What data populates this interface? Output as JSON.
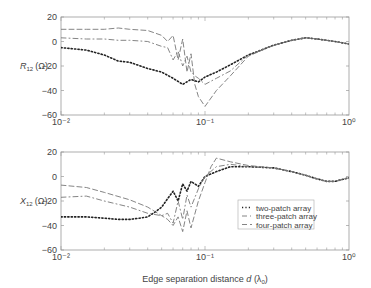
{
  "figure": {
    "xlabel_prefix": "Edge separation distance ",
    "xlabel_var": "d",
    "xlabel_unit": "(λ",
    "xlabel_sub": "0",
    "xlabel_close": ")"
  },
  "chart_data": [
    {
      "type": "line",
      "title": "",
      "ylabel": "R12 (Ω)",
      "ylabel_main": "R",
      "ylabel_sub": "12",
      "ylabel_unit": "(Ω)",
      "xlabel": "",
      "xscale": "log",
      "xlim": [
        0.01,
        1
      ],
      "ylim": [
        -60,
        20
      ],
      "yticks": [
        20,
        0,
        -20,
        -40,
        -60
      ],
      "xtick_labels": [
        "10⁻²",
        "10⁻¹",
        "10⁰"
      ],
      "grid": false,
      "series": [
        {
          "name": "two-patch array",
          "style": "dotted",
          "x": [
            0.01,
            0.015,
            0.02,
            0.025,
            0.03,
            0.04,
            0.05,
            0.06,
            0.07,
            0.08,
            0.09,
            0.1,
            0.12,
            0.15,
            0.2,
            0.3,
            0.4,
            0.5,
            0.6,
            0.8,
            1.0
          ],
          "y": [
            -5,
            -7,
            -11,
            -16,
            -17,
            -22,
            -25,
            -30,
            -35,
            -31,
            -33,
            -29,
            -25,
            -19,
            -11,
            -3,
            1,
            3,
            2,
            0,
            -2
          ]
        },
        {
          "name": "three-patch array",
          "style": "dash-dot",
          "x": [
            0.01,
            0.015,
            0.02,
            0.025,
            0.03,
            0.04,
            0.05,
            0.055,
            0.06,
            0.065,
            0.07,
            0.075,
            0.08,
            0.085,
            0.09,
            0.1,
            0.12,
            0.15,
            0.2,
            0.3,
            0.4,
            0.5,
            0.6,
            0.8,
            1.0
          ],
          "y": [
            3,
            2,
            2,
            1,
            1,
            0,
            -4,
            -5,
            -15,
            -8,
            -20,
            -12,
            -25,
            -28,
            -30,
            -35,
            -30,
            -24,
            -11,
            -3,
            1,
            3,
            2,
            0,
            -2
          ]
        },
        {
          "name": "four-patch array",
          "style": "dashed",
          "x": [
            0.01,
            0.015,
            0.02,
            0.025,
            0.03,
            0.04,
            0.05,
            0.055,
            0.06,
            0.065,
            0.07,
            0.075,
            0.08,
            0.085,
            0.09,
            0.1,
            0.12,
            0.15,
            0.2,
            0.3,
            0.4,
            0.5,
            0.6,
            0.8,
            1.0
          ],
          "y": [
            10,
            10,
            10,
            11,
            10,
            9,
            5,
            0,
            5,
            -15,
            2,
            -25,
            -10,
            -35,
            -45,
            -53,
            -40,
            -28,
            -12,
            -3,
            1,
            3,
            2,
            0,
            -2
          ]
        }
      ]
    },
    {
      "type": "line",
      "title": "",
      "ylabel": "X12 (Ω)",
      "ylabel_main": "X",
      "ylabel_sub": "12",
      "ylabel_unit": "(Ω)",
      "xlabel": "Edge separation distance d (λ0)",
      "xscale": "log",
      "xlim": [
        0.01,
        1
      ],
      "ylim": [
        -60,
        20
      ],
      "yticks": [
        20,
        0,
        -20,
        -40,
        -60
      ],
      "xtick_labels": [
        "10⁻²",
        "10⁻¹",
        "10⁰"
      ],
      "grid": false,
      "legend_position": "center-right",
      "series": [
        {
          "name": "two-patch array",
          "style": "dotted",
          "x": [
            0.01,
            0.015,
            0.02,
            0.025,
            0.03,
            0.035,
            0.04,
            0.045,
            0.05,
            0.055,
            0.06,
            0.065,
            0.07,
            0.075,
            0.08,
            0.09,
            0.1,
            0.12,
            0.15,
            0.2,
            0.3,
            0.4,
            0.5,
            0.6,
            0.7,
            0.8,
            1.0
          ],
          "y": [
            -33,
            -33,
            -34,
            -35,
            -35,
            -34,
            -33,
            -29,
            -25,
            -18,
            -12,
            -20,
            -6,
            -12,
            -4,
            -8,
            0,
            4,
            8,
            8,
            7,
            4,
            1,
            -2,
            -4,
            -4,
            -1
          ]
        },
        {
          "name": "three-patch array",
          "style": "dash-dot",
          "x": [
            0.01,
            0.015,
            0.02,
            0.03,
            0.04,
            0.05,
            0.055,
            0.06,
            0.065,
            0.07,
            0.075,
            0.08,
            0.09,
            0.1,
            0.12,
            0.15,
            0.2,
            0.3,
            0.4,
            0.5,
            0.6,
            0.7,
            0.8,
            1.0
          ],
          "y": [
            -17,
            -16,
            -20,
            -25,
            -30,
            -32,
            -30,
            -38,
            -20,
            -35,
            -15,
            -25,
            -10,
            0,
            8,
            10,
            8,
            7,
            4,
            1,
            -2,
            -4,
            -4,
            -1
          ]
        },
        {
          "name": "four-patch array",
          "style": "dashed",
          "x": [
            0.01,
            0.015,
            0.02,
            0.03,
            0.04,
            0.05,
            0.055,
            0.06,
            0.065,
            0.07,
            0.075,
            0.08,
            0.09,
            0.1,
            0.11,
            0.12,
            0.15,
            0.2,
            0.3,
            0.4,
            0.5,
            0.6,
            0.7,
            0.8,
            1.0
          ],
          "y": [
            -7,
            -9,
            -13,
            -19,
            -25,
            -32,
            -35,
            -40,
            -33,
            -45,
            -28,
            -42,
            -20,
            -5,
            8,
            15,
            12,
            9,
            7,
            4,
            1,
            -2,
            -4,
            -4,
            -1
          ]
        }
      ]
    }
  ],
  "legend": {
    "items": [
      {
        "label": "two-patch array",
        "style": "dotted"
      },
      {
        "label": "three-patch array",
        "style": "dash-dot"
      },
      {
        "label": "four-patch array",
        "style": "dashed"
      }
    ]
  }
}
